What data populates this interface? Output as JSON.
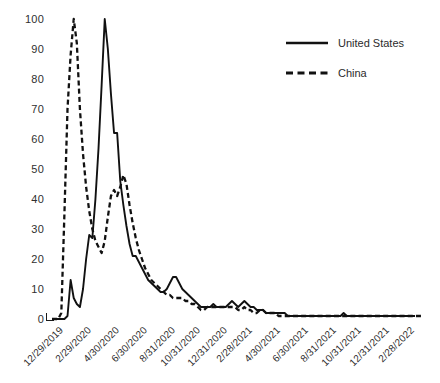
{
  "chart_data": {
    "type": "line",
    "title": "",
    "xlabel": "",
    "ylabel": "",
    "ylim": [
      0,
      100
    ],
    "yticks": [
      0,
      10,
      20,
      30,
      40,
      50,
      60,
      70,
      80,
      90,
      100
    ],
    "ytick_labels": [
      "0",
      "10",
      "20",
      "30",
      "40",
      "50",
      "60",
      "70",
      "80",
      "90",
      "100"
    ],
    "grid": false,
    "legend_position": "top-right",
    "xtick_labels": [
      "12/29/2019",
      "2/29/2020",
      "4/30/2020",
      "6/30/2020",
      "8/31/2020",
      "10/31/2020",
      "12/31/2020",
      "2/28/2021",
      "4/30/2021",
      "6/30/2021",
      "8/31/2021",
      "10/31/2021",
      "12/31/2021",
      "2/28/2022"
    ],
    "xtick_positions": [
      0,
      9,
      18,
      27,
      36,
      44,
      53,
      61,
      70,
      79,
      88,
      96,
      105,
      113
    ],
    "n_points": 118,
    "series": [
      {
        "name": "United States",
        "style": "solid",
        "color": "#111111",
        "values": [
          0,
          0,
          0,
          0,
          0,
          1,
          13,
          7,
          5,
          4,
          10,
          20,
          28,
          27,
          40,
          57,
          78,
          100,
          90,
          75,
          62,
          62,
          46,
          38,
          31,
          25,
          21,
          21,
          19,
          17,
          15,
          13,
          12,
          11,
          10,
          9,
          9,
          10,
          12,
          14,
          14,
          12,
          10,
          9,
          8,
          7,
          6,
          5,
          4,
          4,
          4,
          4,
          5,
          4,
          4,
          4,
          4,
          5,
          6,
          5,
          4,
          5,
          6,
          5,
          4,
          4,
          3,
          3,
          3,
          2,
          2,
          2,
          2,
          2,
          2,
          2,
          1,
          1,
          1,
          1,
          1,
          1,
          1,
          1,
          1,
          1,
          1,
          1,
          1,
          1,
          1,
          1,
          1,
          1,
          2,
          1,
          1,
          1,
          1,
          1,
          1,
          1,
          1,
          1,
          1,
          1,
          1,
          1,
          1,
          1,
          1,
          1,
          1,
          1,
          1,
          1,
          1,
          1
        ]
      },
      {
        "name": "China",
        "style": "dashed",
        "color": "#111111",
        "values": [
          0,
          0,
          0,
          2,
          35,
          70,
          88,
          100,
          92,
          70,
          55,
          44,
          36,
          30,
          26,
          24,
          22,
          26,
          34,
          41,
          43,
          41,
          44,
          48,
          45,
          38,
          32,
          27,
          23,
          20,
          17,
          15,
          13,
          12,
          11,
          10,
          9,
          8,
          8,
          7,
          7,
          7,
          7,
          6,
          6,
          5,
          5,
          4,
          3,
          3,
          4,
          4,
          4,
          4,
          4,
          4,
          4,
          4,
          4,
          4,
          3,
          3,
          4,
          3,
          3,
          2,
          2,
          3,
          3,
          2,
          2,
          2,
          2,
          1,
          1,
          1,
          1,
          1,
          1,
          1,
          1,
          1,
          1,
          1,
          1,
          1,
          1,
          1,
          1,
          1,
          1,
          1,
          1,
          1,
          1,
          1,
          1,
          1,
          1,
          1,
          1,
          1,
          1,
          1,
          1,
          1,
          1,
          1,
          1,
          1,
          1,
          1,
          1,
          1,
          1,
          1,
          1,
          1,
          1,
          1
        ]
      }
    ]
  },
  "legend": {
    "items": [
      {
        "label": "United States",
        "style": "solid"
      },
      {
        "label": "China",
        "style": "dashed"
      }
    ]
  }
}
